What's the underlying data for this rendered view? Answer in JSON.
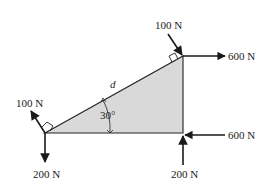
{
  "diagram": {
    "type": "free-body-diagram",
    "shape": "right triangle",
    "fill_color": "#d9d9d9",
    "stroke_color": "#222222",
    "labels": {
      "hypotenuse": "d",
      "angle": "30°"
    },
    "forces": [
      {
        "id": "top-perp",
        "label": "100 N",
        "location": "top-right vertex",
        "direction": "perpendicular to hypotenuse, into vertex"
      },
      {
        "id": "top-horizontal",
        "label": "600 N",
        "location": "top-right vertex",
        "direction": "right"
      },
      {
        "id": "left-perp",
        "label": "100 N",
        "location": "bottom-left vertex",
        "direction": "perpendicular to hypotenuse, outward"
      },
      {
        "id": "left-down",
        "label": "200 N",
        "location": "bottom-left vertex",
        "direction": "down"
      },
      {
        "id": "right-horizontal",
        "label": "600 N",
        "location": "bottom-right vertex",
        "direction": "left"
      },
      {
        "id": "right-up",
        "label": "200 N",
        "location": "bottom-right vertex",
        "direction": "up"
      }
    ]
  }
}
